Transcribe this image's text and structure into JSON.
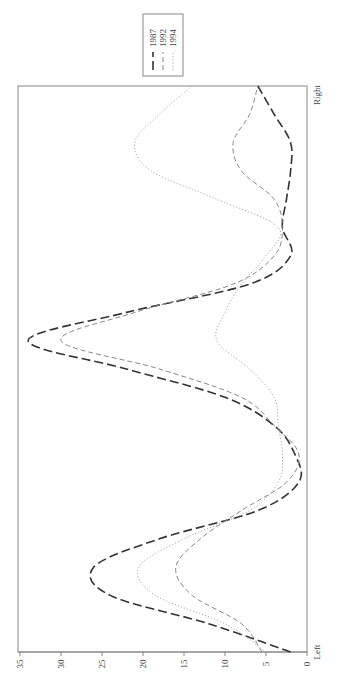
{
  "chart_data": {
    "type": "line",
    "orientation_note": "figure rendered rotated 90 degrees clockwise",
    "title": "",
    "xlabel": "",
    "ylabel": "",
    "x_tick_labels": [
      "Left",
      "Right"
    ],
    "x": [
      0,
      1,
      2,
      3,
      4,
      5,
      6,
      7,
      8,
      9,
      10,
      11,
      12,
      13,
      14,
      15,
      16,
      17,
      18,
      19,
      20
    ],
    "ylim": [
      0,
      35
    ],
    "y_ticks": [
      0,
      5,
      10,
      15,
      20,
      25,
      30,
      35
    ],
    "grid": false,
    "legend_position": "top-right (rotated)",
    "series": [
      {
        "name": "1987",
        "style": "long-dash",
        "color": "#333333",
        "values": [
          2,
          12,
          24,
          26,
          18,
          6,
          1,
          1.5,
          4,
          10,
          22,
          34,
          22,
          7,
          2,
          3,
          2.5,
          2,
          2,
          4,
          6
        ]
      },
      {
        "name": "1992",
        "style": "dash",
        "color": "#888888",
        "values": [
          5.5,
          8,
          14,
          16,
          13,
          8,
          2.5,
          1,
          4,
          8,
          18,
          30,
          21,
          9,
          4,
          3,
          4,
          8,
          9,
          7,
          6
        ]
      },
      {
        "name": "1994",
        "style": "dotted",
        "color": "#aaaaaa",
        "values": [
          5,
          10,
          18.5,
          20.5,
          15,
          7,
          3.5,
          3,
          3.5,
          4,
          7,
          11,
          10,
          8,
          5,
          3.5,
          11,
          19,
          21,
          18,
          14
        ]
      }
    ]
  },
  "legend": {
    "items": [
      {
        "label": "1987"
      },
      {
        "label": "1992"
      },
      {
        "label": "1994"
      }
    ]
  },
  "axis": {
    "x_start_label": "Left",
    "x_end_label": "Right"
  }
}
